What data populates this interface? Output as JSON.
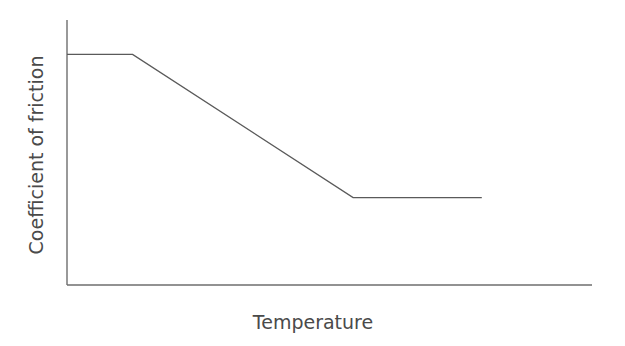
{
  "chart_data": {
    "type": "line",
    "title": "",
    "xlabel": "Temperature",
    "ylabel": "Coefficient of friction",
    "grid": false,
    "legend": null,
    "x_ticks": [],
    "y_ticks": [],
    "xlim": [
      0,
      100
    ],
    "ylim": [
      0,
      100
    ],
    "series": [
      {
        "name": "Coefficient of friction vs Temperature",
        "x": [
          0,
          12.5,
          54.5,
          79
        ],
        "y": [
          87,
          87,
          33,
          33
        ]
      }
    ],
    "annotations": []
  },
  "colors": {
    "axis": "#6e6e6e",
    "line": "#5a5a5a",
    "label": "#4a4a4a",
    "background": "#ffffff"
  }
}
